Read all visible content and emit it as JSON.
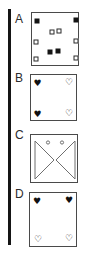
{
  "figure": {
    "colors": {
      "bar": "#151515",
      "box_border": "#4a4a4a",
      "symbol": "#111111",
      "triangle_stroke": "#6f6f6f",
      "background": "#ffffff"
    },
    "icon_glyphs": {
      "heart-filled": "♥",
      "heart-open": "♡"
    }
  },
  "options": [
    {
      "label": "A",
      "label_top": 13,
      "box": {
        "left": 31,
        "top": 12,
        "width": 48,
        "height": 54
      },
      "symbols": [
        {
          "type": "square-filled",
          "x": 4.5,
          "y": 8
        },
        {
          "type": "square-filled",
          "x": 44,
          "y": 6.5
        },
        {
          "type": "square-open",
          "x": 19.5,
          "y": 19
        },
        {
          "type": "square-open",
          "x": 26.5,
          "y": 18
        },
        {
          "type": "square-open",
          "x": 4,
          "y": 29
        },
        {
          "type": "square-open",
          "x": 44,
          "y": 28
        },
        {
          "type": "square-filled",
          "x": 18,
          "y": 39
        },
        {
          "type": "square-filled",
          "x": 25.5,
          "y": 38
        },
        {
          "type": "square-open",
          "x": 4,
          "y": 46
        },
        {
          "type": "square-open",
          "x": 44,
          "y": 44.5
        }
      ]
    },
    {
      "label": "B",
      "label_top": 72,
      "box": {
        "left": 30,
        "top": 74,
        "width": 47,
        "height": 47
      },
      "symbols": [
        {
          "type": "heart-filled",
          "x": 6.5,
          "y": 8
        },
        {
          "type": "heart-open",
          "x": 38,
          "y": 6.5
        },
        {
          "type": "heart-filled",
          "x": 6.5,
          "y": 39
        },
        {
          "type": "heart-open",
          "x": 38,
          "y": 38
        }
      ]
    },
    {
      "label": "C",
      "label_top": 129,
      "box": {
        "left": 30,
        "top": 134,
        "width": 48,
        "height": 49
      },
      "shapes": [
        {
          "type": "triangle",
          "points": "4,6 4,44 23,25"
        },
        {
          "type": "triangle",
          "points": "44,6 44,44 25,25"
        },
        {
          "type": "circle",
          "cx": 17,
          "cy": 7.5,
          "r": 1.6
        },
        {
          "type": "circle",
          "cx": 31,
          "cy": 7.5,
          "r": 1.6
        }
      ]
    },
    {
      "label": "D",
      "label_top": 188,
      "box": {
        "left": 29,
        "top": 192,
        "width": 48,
        "height": 55
      },
      "symbols": [
        {
          "type": "heart-filled",
          "x": 7,
          "y": 8
        },
        {
          "type": "heart-filled",
          "x": 39,
          "y": 7
        },
        {
          "type": "heart-open",
          "x": 8,
          "y": 46
        },
        {
          "type": "heart-open",
          "x": 39,
          "y": 45
        }
      ]
    }
  ]
}
